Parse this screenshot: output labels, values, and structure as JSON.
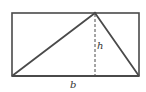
{
  "diagram": {
    "labels": {
      "height": "h",
      "base": "b"
    },
    "colors": {
      "stroke": "#4a4a4a",
      "background": "#ffffff"
    },
    "shapes": {
      "rectangle": {
        "x": 12,
        "y": 13,
        "width": 127,
        "height": 63
      },
      "triangle": {
        "points": [
          [
            12,
            76
          ],
          [
            95,
            13
          ],
          [
            139,
            76
          ]
        ]
      },
      "altitude": {
        "x": 95,
        "y1": 13,
        "y2": 76,
        "style": "dashed"
      }
    }
  }
}
